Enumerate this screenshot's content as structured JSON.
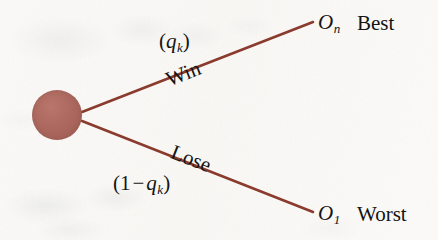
{
  "figure": {
    "type": "decision-tree-diagram",
    "width": 438,
    "height": 240,
    "background_color": "#faf9f7"
  },
  "node": {
    "name": "root-decision-node",
    "shape": "filled-circle",
    "fill_color": "#ab675d",
    "center_x": 57,
    "center_y": 115,
    "radius": 25
  },
  "branches": {
    "line_color": "#8b3a2e",
    "line_width": 2.6,
    "upper": {
      "name": "win-branch",
      "from_x": 82,
      "from_y": 112,
      "to_x": 313,
      "to_y": 22,
      "probability_label": "(q_k)",
      "probability_open_paren": "(",
      "probability_symbol": "q",
      "probability_subscript": "k",
      "probability_close_paren": ")",
      "outcome_label": "Win",
      "endpoint_symbol": "O",
      "endpoint_subscript": "n",
      "endpoint_word": "Best"
    },
    "lower": {
      "name": "lose-branch",
      "from_x": 82,
      "from_y": 121,
      "to_x": 313,
      "to_y": 212,
      "probability_open_paren": "(",
      "probability_one": "1",
      "probability_minus": "−",
      "probability_symbol": "q",
      "probability_subscript": "k",
      "probability_close_paren": ")",
      "probability_label": "(1 − q_k)",
      "outcome_label": "Lose",
      "endpoint_symbol": "O",
      "endpoint_subscript": "1",
      "endpoint_word": "Worst"
    }
  }
}
